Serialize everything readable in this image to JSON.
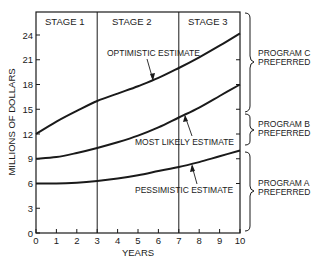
{
  "chart_data": {
    "type": "line",
    "title": "",
    "xlabel": "YEARS",
    "ylabel": "MILLIONS OF DOLLARS",
    "xlim": [
      0,
      10
    ],
    "ylim": [
      0,
      26.5
    ],
    "x_ticks": [
      0,
      1,
      2,
      3,
      4,
      5,
      6,
      7,
      8,
      9,
      10
    ],
    "y_ticks": [
      0,
      3,
      6,
      9,
      12,
      15,
      18,
      21,
      24
    ],
    "grid": false,
    "x": [
      0,
      1,
      2,
      3,
      4,
      5,
      6,
      7,
      8,
      9,
      10
    ],
    "series": [
      {
        "name": "OPTIMISTIC ESTIMATE",
        "values": [
          12,
          13.5,
          14.8,
          16,
          16.9,
          17.8,
          18.8,
          20,
          21.3,
          22.7,
          24.2
        ]
      },
      {
        "name": "MOST LIKELY ESTIMATE",
        "values": [
          9,
          9.2,
          9.7,
          10.3,
          11,
          11.8,
          12.8,
          14,
          15.2,
          16.6,
          18
        ]
      },
      {
        "name": "PESSIMISTIC ESTIMATE",
        "values": [
          6,
          6,
          6.1,
          6.3,
          6.6,
          7,
          7.5,
          8,
          8.6,
          9.3,
          10
        ]
      }
    ],
    "stages": [
      {
        "label": "STAGE 1",
        "from": 0,
        "to": 3
      },
      {
        "label": "STAGE 2",
        "from": 3,
        "to": 7
      },
      {
        "label": "STAGE 3",
        "from": 7,
        "to": 10
      }
    ],
    "regions": [
      {
        "label_line1": "PROGRAM C",
        "label_line2": "PREFERRED",
        "y_from": 14.7,
        "y_to": 26.5
      },
      {
        "label_line1": "PROGRAM B",
        "label_line2": "PREFERRED",
        "y_from": 10.6,
        "y_to": 14.5
      },
      {
        "label_line1": "PROGRAM A",
        "label_line2": "PREFERRED",
        "y_from": 0,
        "y_to": 9.9
      }
    ],
    "annotations": [
      {
        "text": "OPTIMISTIC ESTIMATE",
        "points_to": [
          5.7,
          18.2
        ]
      },
      {
        "text": "MOST LIKELY ESTIMATE",
        "points_to": [
          7.3,
          14.4
        ]
      },
      {
        "text": "PESSIMISTIC ESTIMATE",
        "points_to": [
          7.6,
          8.4
        ]
      }
    ],
    "right_axis_ticks": [
      6,
      9,
      12,
      15,
      18,
      21
    ]
  },
  "labels": {
    "stage1": "STAGE 1",
    "stage2": "STAGE 2",
    "stage3": "STAGE 3",
    "optimistic": "OPTIMISTIC ESTIMATE",
    "likely": "MOST LIKELY ESTIMATE",
    "pessimistic": "PESSIMISTIC ESTIMATE",
    "progC1": "PROGRAM C",
    "progC2": "PREFERRED",
    "progB1": "PROGRAM B",
    "progB2": "PREFERRED",
    "progA1": "PROGRAM A",
    "progA2": "PREFERRED",
    "xlabel": "YEARS",
    "ylabel": "MILLIONS OF DOLLARS"
  },
  "colors": {
    "ink": "#1a1a1a",
    "background": "#ffffff"
  }
}
